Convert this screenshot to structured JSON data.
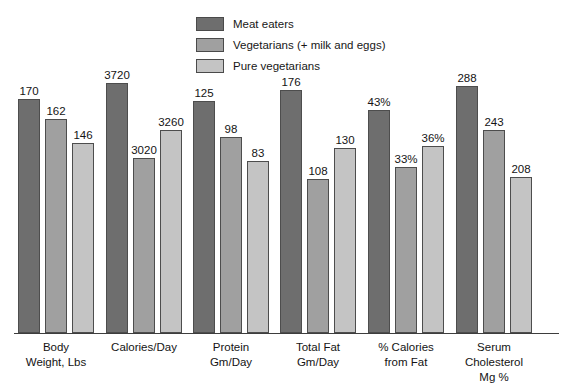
{
  "chart_data": {
    "type": "bar",
    "title": "",
    "subtitle": "",
    "xlabel": "",
    "ylabel": "",
    "grid": false,
    "legend_position": "top-center",
    "note": "Each category group is scaled independently; bar heights are not on a single shared axis.",
    "categories": [
      "Body Weight, Lbs",
      "Calories/Day",
      "Protein Gm/Day",
      "Total Fat Gm/Day",
      "% Calories from Fat",
      "Serum Cholesterol Mg %"
    ],
    "category_label_lines": [
      [
        "Body",
        "Weight, Lbs"
      ],
      [
        "Calories/Day"
      ],
      [
        "Protein",
        "Gm/Day"
      ],
      [
        "Total  Fat",
        "Gm/Day"
      ],
      [
        "% Calories",
        "from Fat"
      ],
      [
        "Serum",
        "Cholesterol",
        "Mg %"
      ]
    ],
    "series": [
      {
        "name": "Meat eaters",
        "color": "#6e6e6e",
        "values": [
          170,
          3720,
          125,
          176,
          43,
          288
        ],
        "labels": [
          "170",
          "3720",
          "125",
          "176",
          "43%",
          "288"
        ]
      },
      {
        "name": "Vegetarians (+ milk and eggs)",
        "color": "#a0a0a0",
        "values": [
          162,
          3020,
          98,
          108,
          33,
          243
        ],
        "labels": [
          "162",
          "3020",
          "98",
          "108",
          "33%",
          "243"
        ]
      },
      {
        "name": "Pure vegetarians",
        "color": "#c4c4c4",
        "values": [
          146,
          3260,
          83,
          130,
          36,
          208
        ],
        "labels": [
          "146",
          "3260",
          "83",
          "130",
          "36%",
          "208"
        ]
      }
    ],
    "bar_pixel_heights": [
      [
        234,
        214,
        190
      ],
      [
        250,
        175,
        203
      ],
      [
        232,
        196,
        172
      ],
      [
        243,
        154,
        185
      ],
      [
        223,
        166,
        187
      ],
      [
        247,
        203,
        156
      ]
    ]
  },
  "legend": {
    "items": [
      {
        "label": "Meat eaters",
        "color": "#6e6e6e"
      },
      {
        "label": "Vegetarians (+ milk and eggs)",
        "color": "#a0a0a0"
      },
      {
        "label": "Pure vegetarians",
        "color": "#c4c4c4"
      }
    ]
  }
}
